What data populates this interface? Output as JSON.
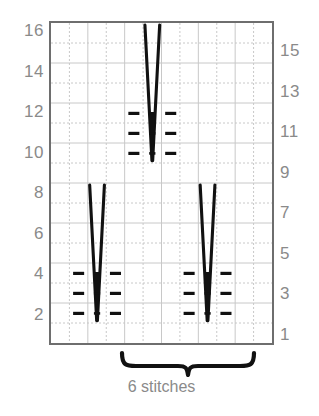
{
  "chart_data": {
    "type": "table",
    "title": "",
    "subtitle": "",
    "xlabel": "",
    "ylabel": "",
    "grid": true,
    "legend_position": "none",
    "columns": 12,
    "rows": 16,
    "row_axis_left_label": "even rows",
    "row_axis_right_label": "odd rows",
    "left_tick_labels": [
      "16",
      "14",
      "12",
      "10",
      "8",
      "6",
      "4",
      "2"
    ],
    "left_tick_rows": [
      16,
      14,
      12,
      10,
      8,
      6,
      4,
      2
    ],
    "right_tick_labels": [
      "15",
      "13",
      "11",
      "9",
      "7",
      "5",
      "3",
      "1"
    ],
    "right_tick_rows": [
      15,
      13,
      11,
      9,
      7,
      5,
      3,
      1
    ],
    "annotations": [
      {
        "text": "6 stitches",
        "type": "brace-caption",
        "span_columns": [
          4,
          10
        ]
      }
    ],
    "motifs": [
      {
        "name": "cluster-bottom-left",
        "center_column": 3,
        "base_row": 2,
        "taper_top_row": 8,
        "purl_columns": [
          2,
          4
        ],
        "purl_rows": [
          2,
          3,
          4
        ]
      },
      {
        "name": "cluster-bottom-right",
        "center_column": 9,
        "base_row": 2,
        "taper_top_row": 8,
        "purl_columns": [
          8,
          10
        ],
        "purl_rows": [
          2,
          3,
          4
        ]
      },
      {
        "name": "cluster-top-center",
        "center_column": 6,
        "base_row": 10,
        "taper_top_row": 16,
        "purl_columns": [
          5,
          7
        ],
        "purl_rows": [
          10,
          11,
          12
        ]
      }
    ],
    "symbols": {
      "purl_dash": "—",
      "cluster": "V-taper"
    },
    "colors": {
      "symbol": "#111111",
      "grid_line": "#c8c8c8",
      "border": "#6e6e6e",
      "axis_text": "#8a8a8a",
      "background": "#ffffff"
    }
  },
  "caption": {
    "text": "6 stitches"
  },
  "icons": {
    "brace": "curly-brace-icon"
  }
}
